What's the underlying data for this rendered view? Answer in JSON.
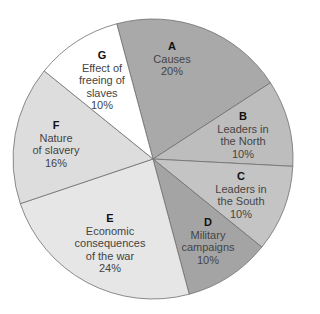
{
  "chart_data": {
    "type": "pie",
    "title": "",
    "start_angle_deg": -15,
    "direction": "clockwise",
    "center": [
      153,
      159
    ],
    "radius": 140,
    "slices": [
      {
        "key": "A",
        "label": "Causes",
        "value": 20,
        "pct_label": "20%",
        "color": "#a9a9a9",
        "lines": [
          "Causes"
        ],
        "label_pos": [
          172,
          40
        ]
      },
      {
        "key": "B",
        "label": "Leaders in the North",
        "value": 10,
        "pct_label": "10%",
        "color": "#bdbdbd",
        "lines": [
          "Leaders in",
          "the North"
        ],
        "label_pos": [
          243,
          110
        ]
      },
      {
        "key": "C",
        "label": "Leaders in the South",
        "value": 10,
        "pct_label": "10%",
        "color": "#c4c4c4",
        "lines": [
          "Leaders in",
          "the South"
        ],
        "label_pos": [
          241,
          170
        ]
      },
      {
        "key": "D",
        "label": "Military campaigns",
        "value": 10,
        "pct_label": "10%",
        "color": "#a4a4a4",
        "lines": [
          "Military",
          "campaigns"
        ],
        "label_pos": [
          208,
          216
        ]
      },
      {
        "key": "E",
        "label": "Economic consequences of the war",
        "value": 24,
        "pct_label": "24%",
        "color": "#e6e6e6",
        "lines": [
          "Economic",
          "consequences",
          "of the war"
        ],
        "label_pos": [
          110,
          212
        ]
      },
      {
        "key": "F",
        "label": "Nature of slavery",
        "value": 16,
        "pct_label": "16%",
        "color": "#dddddd",
        "lines": [
          "Nature",
          "of slavery"
        ],
        "label_pos": [
          56,
          119
        ]
      },
      {
        "key": "G",
        "label": "Effect of freeing of slaves",
        "value": 10,
        "pct_label": "10%",
        "color": "#ffffff",
        "lines": [
          "Effect of",
          "freeing of",
          "slaves"
        ],
        "label_pos": [
          102,
          49
        ]
      }
    ],
    "stroke_color": "#6e6e6e",
    "legend": "none"
  }
}
